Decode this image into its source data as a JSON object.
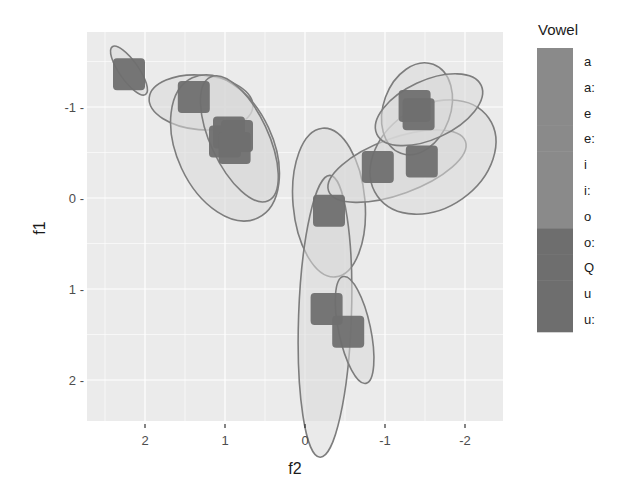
{
  "chart_data": {
    "type": "scatter",
    "title": "",
    "xlabel": "f2",
    "ylabel": "f1",
    "x_reversed": true,
    "y_reversed": true,
    "xlim": [
      2.7,
      -2.5
    ],
    "ylim": [
      -1.83,
      2.45
    ],
    "x_ticks": [
      2,
      1,
      0,
      -1,
      -2
    ],
    "x_tick_labels": [
      "2",
      "1",
      "0",
      "-1",
      "-2"
    ],
    "y_ticks": [
      -1,
      0,
      1,
      2
    ],
    "y_tick_labels": [
      "-1 -",
      "0 -",
      "1 -",
      "2 -"
    ],
    "grid": true,
    "legend": {
      "title": "Vowel",
      "position": "right",
      "entries": [
        "a",
        "a:",
        "e",
        "e:",
        "i",
        "i:",
        "o",
        "o:",
        "Q",
        "u",
        "u:"
      ]
    },
    "points": [
      {
        "f2": 2.2,
        "f1": -1.36
      },
      {
        "f2": 1.39,
        "f1": -1.11
      },
      {
        "f2": 0.95,
        "f1": -0.72
      },
      {
        "f2": 1.0,
        "f1": -0.62
      },
      {
        "f2": 0.85,
        "f1": -0.68
      },
      {
        "f2": 0.88,
        "f1": -0.55
      },
      {
        "f2": -0.3,
        "f1": 0.14
      },
      {
        "f2": -0.27,
        "f1": 1.22
      },
      {
        "f2": -0.54,
        "f1": 1.47
      },
      {
        "f2": -0.91,
        "f1": -0.34
      },
      {
        "f2": -1.46,
        "f1": -0.4
      },
      {
        "f2": -1.37,
        "f1": -1.01
      },
      {
        "f2": -1.42,
        "f1": -0.92
      }
    ],
    "ellipses": [
      {
        "cx": 2.2,
        "cy": -1.4,
        "rx": 0.12,
        "ry": 0.32,
        "angle": -35
      },
      {
        "cx": 1.3,
        "cy": -1.05,
        "rx": 0.65,
        "ry": 0.3,
        "angle": 5
      },
      {
        "cx": 1.0,
        "cy": -0.55,
        "rx": 0.6,
        "ry": 0.85,
        "angle": -25
      },
      {
        "cx": 0.82,
        "cy": -0.65,
        "rx": 0.36,
        "ry": 0.75,
        "angle": -25
      },
      {
        "cx": -0.3,
        "cy": 0.05,
        "rx": 0.45,
        "ry": 0.82,
        "angle": -5
      },
      {
        "cx": -0.25,
        "cy": 1.3,
        "rx": 0.33,
        "ry": 1.55,
        "angle": 2
      },
      {
        "cx": -0.62,
        "cy": 1.45,
        "rx": 0.2,
        "ry": 0.6,
        "angle": -12
      },
      {
        "cx": -1.15,
        "cy": -0.35,
        "rx": 0.35,
        "ry": 0.8,
        "angle": 70
      },
      {
        "cx": -1.6,
        "cy": -0.45,
        "rx": 0.85,
        "ry": 0.56,
        "angle": -35
      },
      {
        "cx": -1.4,
        "cy": -0.98,
        "rx": 0.42,
        "ry": 0.52,
        "angle": 20
      },
      {
        "cx": -1.55,
        "cy": -0.97,
        "rx": 0.72,
        "ry": 0.32,
        "angle": -25
      }
    ]
  },
  "colors": {
    "panel_bg": "#ebebeb",
    "grid": "#ffffff",
    "point_fill": "#6f6f6f",
    "ellipse_fill": "#d8d8d8",
    "ellipse_stroke": "#7d7d7d",
    "legend_light": "#8a8a8a",
    "legend_dark": "#6e6e6e"
  }
}
